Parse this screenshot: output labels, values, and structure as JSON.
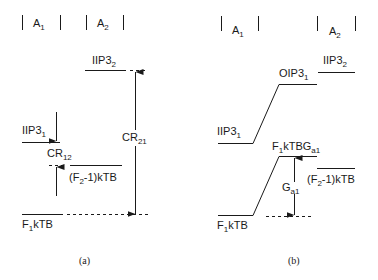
{
  "panel_a": {
    "header": {
      "a1": "A",
      "a1_sub": "1",
      "a2": "A",
      "a2_sub": "2"
    },
    "labels": {
      "iip3_2": "IIP3",
      "iip3_2_sub": "2",
      "iip3_1": "IIP3",
      "iip3_1_sub": "1",
      "cr21": "CR",
      "cr21_sub": "21",
      "cr12": "CR",
      "cr12_sub": "12",
      "f2kTB_pre": "(F",
      "f2kTB_sub": "2",
      "f2kTB_post": "-1)kTB",
      "f1kTB_pre": "F",
      "f1kTB_sub": "1",
      "f1kTB_post": "kTB"
    },
    "caption": "(a)"
  },
  "panel_b": {
    "header": {
      "a1": "A",
      "a1_sub": "1",
      "a2": "A",
      "a2_sub": "2"
    },
    "labels": {
      "iip3_2": "IIP3",
      "iip3_2_sub": "2",
      "oip3_1": "OIP3",
      "oip3_1_sub": "1",
      "iip3_1": "IIP3",
      "iip3_1_sub": "1",
      "f1kTBGa1_pre": "F",
      "f1kTBGa1_sub1": "1",
      "f1kTBGa1_mid": "kTBG",
      "f1kTBGa1_sub2": "a1",
      "ga1": "G",
      "ga1_sub": "a1",
      "f2kTB_pre": "(F",
      "f2kTB_sub": "2",
      "f2kTB_post": "-1)kTB",
      "f1kTB_pre": "F",
      "f1kTB_sub": "1",
      "f1kTB_post": "kTB"
    },
    "caption": "(b)"
  },
  "colors": {
    "stroke": "#1a1a1a",
    "background": "#ffffff"
  }
}
